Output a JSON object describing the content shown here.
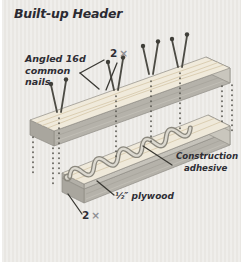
{
  "title": "Built-up Header",
  "labels": {
    "nails": {
      "lines": [
        "Angled 16d",
        "common",
        "nails"
      ]
    },
    "top_lumber": {
      "number": "2",
      "symbol": "×"
    },
    "adhesive": {
      "lines": [
        "Construction",
        "adhesive"
      ]
    },
    "plywood": {
      "text": "½″ plywood"
    },
    "bottom_lumber": {
      "number": "2",
      "symbol": "×"
    }
  },
  "colors": {
    "card_background": "#e9e7e3",
    "label_text": "#2e2d34",
    "muted_symbol": "#8f8f94",
    "wood_top_face": "#f0eadb",
    "wood_front_face": "#b5b2aa",
    "wood_end_face": "#a9a69e",
    "plywood_edge": "#c6c3bb",
    "adhesive_light": "#dcd9d0",
    "adhesive_dark": "#8b887e",
    "nail": "#4c4b44",
    "dotted_line": "#54534c",
    "leader_line": "#3a3934"
  }
}
